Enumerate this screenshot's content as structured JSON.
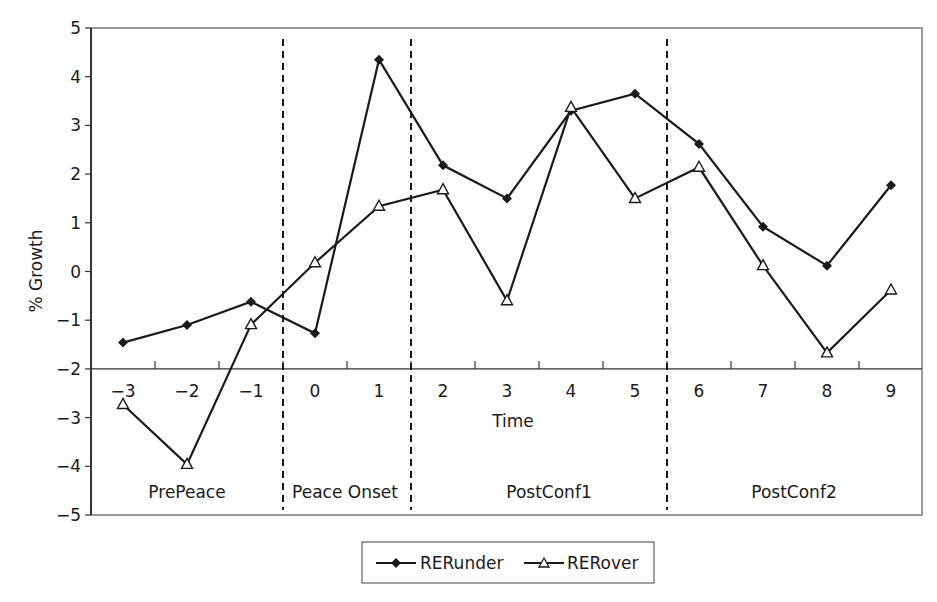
{
  "chart_data": {
    "type": "line",
    "title": "",
    "xlabel": "Time",
    "ylabel": "% Growth",
    "ylim": [
      -5,
      5
    ],
    "yticks": [
      5,
      4,
      3,
      2,
      1,
      0,
      -1,
      -2,
      -3,
      -4,
      -5
    ],
    "ytick_labels": [
      "5",
      "4",
      "3",
      "2",
      "1",
      "0",
      "−1",
      "−2",
      "−3",
      "−4",
      "−5"
    ],
    "x_axis_crosses_at": -2,
    "x": [
      -3,
      -2,
      -1,
      0,
      1,
      2,
      3,
      4,
      5,
      6,
      7,
      8,
      9
    ],
    "xtick_labels": [
      "−3",
      "−2",
      "−1",
      "0",
      "1",
      "2",
      "3",
      "4",
      "5",
      "6",
      "7",
      "8",
      "9"
    ],
    "grid": false,
    "legend_position": "bottom",
    "series": [
      {
        "name": "RERunder",
        "marker": "filled-diamond",
        "values": [
          -1.46,
          -1.1,
          -0.62,
          -1.27,
          4.35,
          2.18,
          1.5,
          3.3,
          3.65,
          2.62,
          0.92,
          0.12,
          1.77
        ]
      },
      {
        "name": "RERover",
        "marker": "open-triangle",
        "values": [
          -2.73,
          -3.96,
          -1.09,
          0.18,
          1.34,
          1.68,
          -0.6,
          3.37,
          1.5,
          2.14,
          0.12,
          -1.67,
          -0.38
        ]
      }
    ],
    "regions": [
      {
        "label": "PrePeace",
        "from": -3.5,
        "to": -0.5
      },
      {
        "label": "Peace Onset",
        "from": -0.5,
        "to": 1.5
      },
      {
        "label": "PostConf1",
        "from": 1.5,
        "to": 5.5
      },
      {
        "label": "PostConf2",
        "from": 5.5,
        "to": 9.5
      }
    ],
    "annotations": [
      {
        "type": "dashed-vertical-line",
        "x": -0.5
      },
      {
        "type": "dashed-vertical-line",
        "x": 1.5
      },
      {
        "type": "dashed-vertical-line",
        "x": 5.5
      }
    ]
  },
  "legend": {
    "items": [
      {
        "label": "RERunder",
        "icon": "filled-diamond-line-icon"
      },
      {
        "label": "RERover",
        "icon": "open-triangle-line-icon"
      }
    ]
  },
  "colors": {
    "line": "#1a1a1a",
    "frame": "#7a7a7a",
    "background": "#ffffff"
  }
}
